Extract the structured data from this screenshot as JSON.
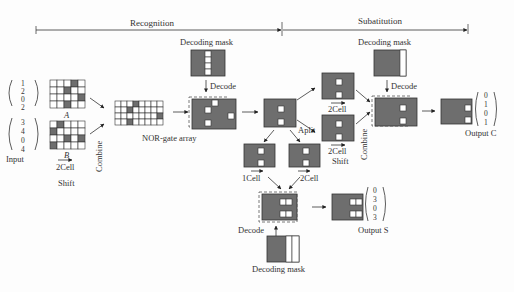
{
  "header": {
    "recognition_label": "Recognition",
    "substitution_label": "Subatitution"
  },
  "input": {
    "label": "Input",
    "vector_a": [
      "1",
      "2",
      "0",
      "2"
    ],
    "vector_b": [
      "3",
      "4",
      "0",
      "4"
    ],
    "grid_a_label": "A",
    "grid_b_label": "B",
    "shift_amount": "2Cell",
    "shift_label": "Shift",
    "combine_label": "Combine"
  },
  "recognition": {
    "nor_label": "NOR-gate array",
    "decoding_mask_label": "Decoding mask",
    "decode_label": "Decode"
  },
  "substitution": {
    "split_label": "Aplit",
    "top_shift": "2Cell",
    "bottom_shift": "2Cell",
    "bottom_shift_label": "Shift",
    "combine_label": "Combine",
    "decoding_mask_label": "Decoding mask",
    "decode_label": "Decode",
    "output_c_label": "Output C",
    "output_c_vector": [
      "0",
      "1",
      "0",
      "1"
    ],
    "lower_left_shift": "1Cell",
    "lower_right_shift": "2Cell",
    "lower_decode_label": "Decode",
    "lower_mask_label": "Decoding mask",
    "output_s_label": "Output S",
    "output_s_vector": [
      "0",
      "3",
      "0",
      "3"
    ]
  },
  "colors": {
    "cell_dark": "#6e6e6e",
    "cell_light": "#ffffff",
    "line": "#333333"
  }
}
